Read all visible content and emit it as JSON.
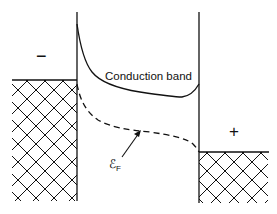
{
  "diagram": {
    "title": "",
    "labels": {
      "conduction_band": "Conduction band",
      "left_electrode_sign": "−",
      "right_electrode_sign": "+",
      "fermi_level_symbol": "ℰ",
      "fermi_level_subscript": "F"
    },
    "elements": [
      {
        "id": "left-metal",
        "type": "hatched-region",
        "description": "Left metal electrode (negative)"
      },
      {
        "id": "right-metal",
        "type": "hatched-region",
        "description": "Right metal electrode (positive)"
      },
      {
        "id": "insulator-left-boundary",
        "type": "vertical-line"
      },
      {
        "id": "insulator-right-boundary",
        "type": "vertical-line"
      },
      {
        "id": "conduction-band-curve",
        "type": "solid-curve"
      },
      {
        "id": "fermi-level-curve",
        "type": "dashed-curve"
      },
      {
        "id": "fermi-level-arrow",
        "type": "arrow"
      }
    ],
    "colors": {
      "line": "#111111",
      "background": "#ffffff"
    }
  }
}
